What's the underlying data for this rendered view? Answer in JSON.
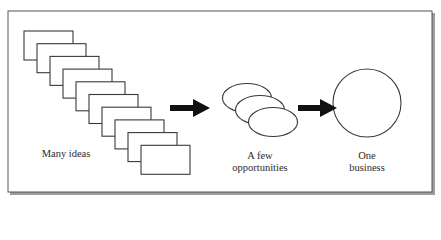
{
  "diagram": {
    "title": "",
    "frame": {
      "x": 8,
      "y": 11,
      "width": 424,
      "height": 181,
      "stroke": "#555555",
      "shadow": "#9a9a9a"
    },
    "stages": [
      {
        "id": "ideas",
        "label_lines": [
          "Many ideas"
        ],
        "shape": "rectangle",
        "count": 10,
        "rect": {
          "x0": 24,
          "y0": 31,
          "width": 49,
          "height": 29,
          "dx": 13,
          "dy": 12.7
        }
      },
      {
        "id": "opportunities",
        "label_lines": [
          "A few",
          "opportunities"
        ],
        "shape": "ellipse",
        "count": 3,
        "ellipses": [
          {
            "cx": 247,
            "cy": 98,
            "rx": 24.5,
            "ry": 14.5
          },
          {
            "cx": 260,
            "cy": 110,
            "rx": 24.5,
            "ry": 14.5
          },
          {
            "cx": 273,
            "cy": 122,
            "rx": 24.5,
            "ry": 14.5
          }
        ]
      },
      {
        "id": "business",
        "label_lines": [
          "One",
          "business"
        ],
        "shape": "circle",
        "count": 1,
        "circle": {
          "cx": 367,
          "cy": 103,
          "r": 34
        }
      }
    ],
    "arrows": [
      {
        "from": "ideas",
        "to": "opportunities",
        "x0": 170,
        "x1": 210,
        "y": 108,
        "color": "#111111"
      },
      {
        "from": "opportunities",
        "to": "business",
        "x0": 298,
        "x1": 337,
        "y": 108,
        "color": "#111111"
      }
    ],
    "colors": {
      "stroke": "#3a3a3a",
      "fill": "#ffffff",
      "text": "#2a2a2a",
      "arrow": "#111111"
    }
  }
}
